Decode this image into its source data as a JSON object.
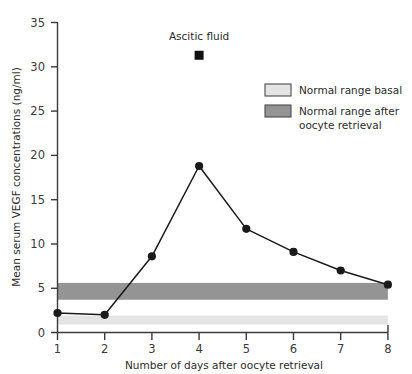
{
  "chart_data": {
    "type": "line",
    "title": "",
    "xlabel": "Number of days after oocyte retrieval",
    "ylabel": "Mean serum VEGF concentrations (ng/ml)",
    "x": [
      1,
      2,
      3,
      4,
      5,
      6,
      7,
      8
    ],
    "xtick_labels": [
      "1",
      "2",
      "3",
      "4",
      "5",
      "6",
      "7",
      "8"
    ],
    "ytick_labels": [
      "0",
      "5",
      "10",
      "15",
      "20",
      "25",
      "30",
      "35"
    ],
    "ytick_values": [
      0,
      5,
      10,
      15,
      20,
      25,
      30,
      35
    ],
    "xlim": [
      1,
      8
    ],
    "ylim": [
      0,
      35
    ],
    "grid": false,
    "legend_position": "upper-right",
    "series": [
      {
        "name": "Mean serum VEGF",
        "marker": "circle",
        "color": "#1a1a1a",
        "values": [
          2.2,
          2.0,
          8.6,
          18.8,
          11.7,
          9.1,
          7.0,
          5.4
        ]
      }
    ],
    "points": [
      {
        "name": "Ascitic fluid",
        "x": 4,
        "y": 31.3,
        "marker": "square",
        "color": "#111111"
      }
    ],
    "bands": [
      {
        "name": "Normal range basal",
        "ymin": 0.9,
        "ymax": 1.9,
        "color": "#e4e4e4"
      },
      {
        "name": "Normal range after oocyte retrieval",
        "ymin": 3.7,
        "ymax": 5.6,
        "color": "#949494"
      }
    ],
    "annotations": [
      {
        "text": "Ascitic fluid",
        "x": 4,
        "y": 33.5
      }
    ],
    "legend": [
      {
        "label": "Normal range basal",
        "swatch": "#e4e4e4",
        "border": "#4a4a4a"
      },
      {
        "label": "Normal range after oocyte retrieval",
        "label_line1": "Normal range after",
        "label_line2": "oocyte retrieval",
        "swatch": "#949494",
        "border": "#4a4a4a"
      }
    ]
  },
  "axis": {
    "y_title": "Mean serum VEGF concentrations (ng/ml)",
    "x_title": "Number of days after oocyte retrieval",
    "y_ticks": [
      "35",
      "30",
      "25",
      "20",
      "15",
      "10",
      "5",
      "0"
    ],
    "x_ticks": [
      "1",
      "2",
      "3",
      "4",
      "5",
      "6",
      "7",
      "8"
    ]
  },
  "annotation": {
    "ascitic_label": "Ascitic fluid"
  },
  "legend": {
    "item1_label": "Normal range basal",
    "item2_label_line1": "Normal range after",
    "item2_label_line2": "oocyte retrieval"
  },
  "colors": {
    "axis": "#3a3a3a",
    "line": "#1a1a1a",
    "marker": "#111111",
    "band_basal": "#e4e4e4",
    "band_after": "#949494",
    "background": "#ffffff"
  }
}
